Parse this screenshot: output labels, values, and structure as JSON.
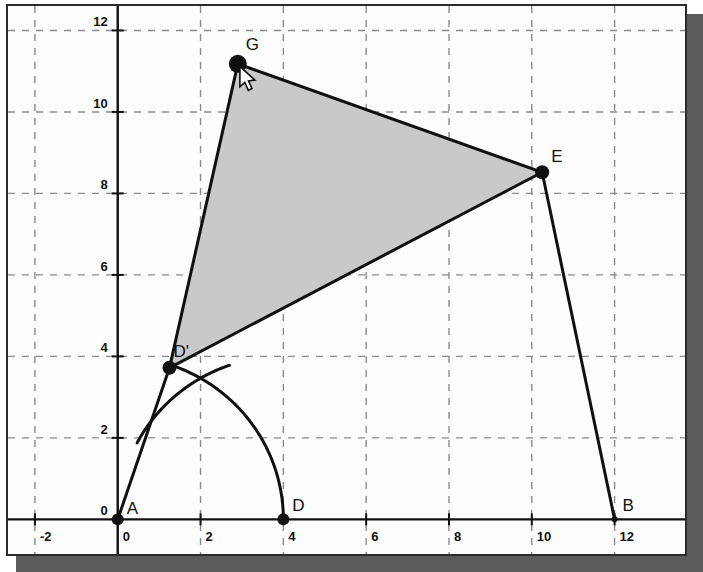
{
  "window": {
    "title": "Geometry Construction View",
    "background_color": "#ffffff",
    "frame_border_color": "#2b2b2b",
    "shadow_color": "#5b5b5b"
  },
  "chart_data": {
    "type": "scatter",
    "title": "",
    "xlabel": "",
    "ylabel": "",
    "xlim": [
      -2.65,
      13.7
    ],
    "ylim": [
      -0.85,
      12.6
    ],
    "grid": true,
    "grid_style": "dashed",
    "grid_color": "#8a8a8a",
    "axis_color": "#101010",
    "xticks": [
      -2,
      0,
      2,
      4,
      6,
      8,
      10,
      12
    ],
    "xtick_labels": [
      "-2",
      "0",
      "2",
      "4",
      "6",
      "8",
      "10",
      "12"
    ],
    "yticks": [
      0,
      2,
      4,
      6,
      8,
      10,
      12
    ],
    "ytick_labels": [
      "0",
      "2",
      "4",
      "6",
      "8",
      "10",
      "12"
    ],
    "points": [
      {
        "name": "A",
        "label": "A",
        "x": 0.0,
        "y": 0.0,
        "radius": 6,
        "color": "#101010",
        "label_dx": 9,
        "label_dy": -5
      },
      {
        "name": "D",
        "label": "D",
        "x": 4.0,
        "y": 0.0,
        "radius": 6,
        "color": "#101010",
        "label_dx": 9,
        "label_dy": -8
      },
      {
        "name": "B",
        "label": "B",
        "x": 12.0,
        "y": 0.0,
        "radius": 3,
        "color": "#101010",
        "label_dx": 8,
        "label_dy": -8
      },
      {
        "name": "Dp",
        "label": "D'",
        "x": 1.25,
        "y": 3.72,
        "radius": 7,
        "color": "#101010",
        "label_dx": 4,
        "label_dy": -11
      },
      {
        "name": "G",
        "label": "G",
        "x": 2.9,
        "y": 11.18,
        "radius": 9,
        "color": "#101010",
        "label_dx": 8,
        "label_dy": -14
      },
      {
        "name": "E",
        "label": "E",
        "x": 10.25,
        "y": 8.52,
        "radius": 7,
        "color": "#101010",
        "label_dx": 9,
        "label_dy": -10
      }
    ],
    "polygon": {
      "name": "shaded-triangle",
      "vertices": [
        "Dp",
        "G",
        "E"
      ],
      "fill": "#c9c9c9",
      "stroke": "#101010",
      "stroke_width": 3
    },
    "segments": [
      {
        "name": "segment-A-Dp",
        "from": [
          0.0,
          0.0
        ],
        "to": [
          1.25,
          3.72
        ],
        "stroke": "#101010",
        "stroke_width": 3
      },
      {
        "name": "segment-E-B",
        "from": [
          10.25,
          8.52
        ],
        "to": [
          12.0,
          0.0
        ],
        "stroke": "#101010",
        "stroke_width": 3
      }
    ],
    "arcs": [
      {
        "name": "arc-centered-at-A",
        "center": [
          0.0,
          0.0
        ],
        "radius": 4.0,
        "start_angle_deg": 0,
        "end_angle_deg": 71.4,
        "stroke": "#101010",
        "stroke_width": 3
      },
      {
        "name": "arc-centered-at-D",
        "center": [
          4.0,
          0.0
        ],
        "radius": 4.0,
        "start_angle_deg": 109,
        "end_angle_deg": 152,
        "stroke": "#101010",
        "stroke_width": 3
      }
    ],
    "cursor": {
      "name": "mouse-cursor",
      "shape": "arrow",
      "tip_x": 2.95,
      "tip_y": 11.12,
      "fill": "#ffffff",
      "stroke": "#101010"
    }
  }
}
